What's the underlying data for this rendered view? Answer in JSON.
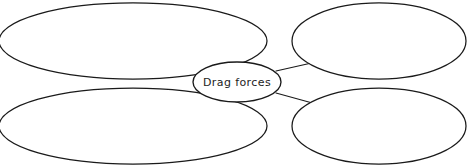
{
  "diagram": {
    "type": "concept-map",
    "title_node": {
      "label": "Drag forces",
      "shape": "ellipse",
      "cx": 237,
      "cy": 82,
      "rx": 44,
      "ry": 20,
      "fill": "#ffffff",
      "stroke": "#1a1a1a"
    },
    "background": "#ffffff",
    "stroke_color": "#1a1a1a",
    "branch_nodes": [
      {
        "name": "top-left",
        "label": "",
        "cx": 133,
        "cy": 41,
        "rx": 134,
        "ry": 38
      },
      {
        "name": "top-right",
        "label": "",
        "cx": 379,
        "cy": 41,
        "rx": 87,
        "ry": 38
      },
      {
        "name": "bottom-left",
        "label": "",
        "cx": 133,
        "cy": 126,
        "rx": 134,
        "ry": 38
      },
      {
        "name": "bottom-right",
        "label": "",
        "cx": 379,
        "cy": 126,
        "rx": 87,
        "ry": 38
      }
    ],
    "connectors": [
      {
        "name": "connector-top-left",
        "x1": 199,
        "y1": 71,
        "x2": 166,
        "y2": 62
      },
      {
        "name": "connector-top-right",
        "x1": 276,
        "y1": 71,
        "x2": 316,
        "y2": 62
      },
      {
        "name": "connector-bottom-left",
        "x1": 199,
        "y1": 93,
        "x2": 166,
        "y2": 104
      },
      {
        "name": "connector-bottom-right",
        "x1": 276,
        "y1": 93,
        "x2": 316,
        "y2": 104
      }
    ]
  }
}
